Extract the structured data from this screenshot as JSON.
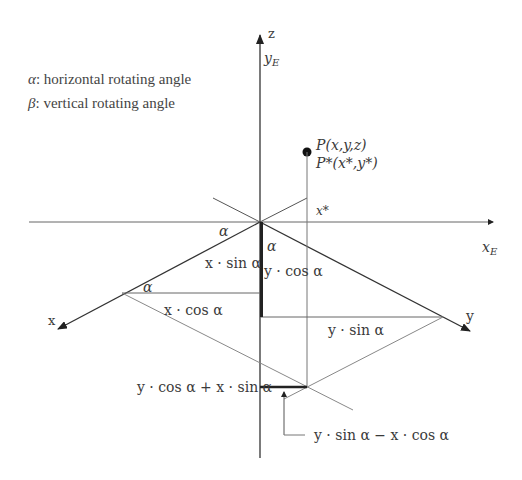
{
  "legend": {
    "alpha_symbol": "α",
    "alpha_text": ": horizontal rotating angle",
    "beta_symbol": "β",
    "beta_text": ": vertical rotating angle"
  },
  "axes": {
    "z_label": "z",
    "yE_label": "y",
    "yE_sub": "E",
    "xE_label": "x",
    "xE_sub": "E",
    "x_label": "x",
    "y_label": "y"
  },
  "point": {
    "P_label": "P(x,y,z)",
    "Pstar_label": "P*(x*,y*)",
    "xstar_label": "x*"
  },
  "angles": {
    "alpha_top_left": "α",
    "alpha_top_right": "α",
    "alpha_left": "α"
  },
  "segments": {
    "x_sin": "x · sin α",
    "y_cos": "y · cos α",
    "x_cos": "x · cos α",
    "y_sin": "y · sin α",
    "sum": "y · cos α + x · sin α",
    "diff": "y · sin α − x · cos α"
  },
  "colors": {
    "axis": "#333333",
    "thin": "#8a8a8a",
    "thick": "#222222",
    "text": "#3a3a3a"
  }
}
